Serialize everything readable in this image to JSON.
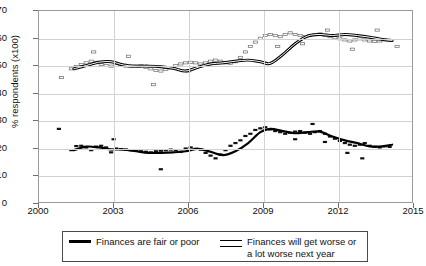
{
  "chart_data": {
    "type": "line",
    "title": "",
    "xlabel": "",
    "ylabel": "% respondents (x100)",
    "xlim": [
      2000,
      2015
    ],
    "ylim": [
      0,
      70
    ],
    "yticks": [
      0,
      10,
      20,
      30,
      40,
      50,
      60,
      70
    ],
    "xticks": [
      2000,
      2003,
      2006,
      2009,
      2012,
      2015
    ],
    "grid": true,
    "legend_position": "bottom",
    "series": [
      {
        "name": "Finances are fair or poor",
        "marker": "filled-dash",
        "line_style": "solid-thick-black",
        "trend_x": [
          2001.4,
          2001.9,
          2002.4,
          2002.9,
          2003.4,
          2003.9,
          2004.4,
          2004.9,
          2005.4,
          2005.9,
          2006.4,
          2006.9,
          2007.4,
          2007.9,
          2008.4,
          2008.9,
          2009.3,
          2009.8,
          2010.3,
          2010.8,
          2011.3,
          2011.8,
          2012.3,
          2012.8,
          2013.3,
          2013.8,
          2014.2
        ],
        "trend_y": [
          19.0,
          20.3,
          20.0,
          19.3,
          19.2,
          18.6,
          18.0,
          18.0,
          18.2,
          18.6,
          19.5,
          18.4,
          17.2,
          18.6,
          21.5,
          25.6,
          26.8,
          26.0,
          25.2,
          25.6,
          25.8,
          24.0,
          22.6,
          21.6,
          20.4,
          20.4,
          21.0
        ],
        "points_x": [
          2001.3,
          2001.5,
          2001.7,
          2001.9,
          2002.1,
          2002.3,
          2002.5,
          2002.7,
          2002.9,
          2003.1,
          2003.3,
          2003.5,
          2003.7,
          2003.9,
          2004.1,
          2004.3,
          2004.5,
          2004.7,
          2004.9,
          2005.1,
          2005.3,
          2005.5,
          2005.7,
          2005.9,
          2006.1,
          2006.3,
          2006.5,
          2006.7,
          2006.9,
          2007.1,
          2007.3,
          2007.5,
          2007.7,
          2007.9,
          2008.1,
          2008.3,
          2008.5,
          2008.7,
          2008.9,
          2009.1,
          2009.3,
          2009.5,
          2009.7,
          2009.9,
          2010.1,
          2010.3,
          2010.5,
          2010.7,
          2010.9,
          2011.1,
          2011.3,
          2011.5,
          2011.7,
          2011.9,
          2012.1,
          2012.3,
          2012.5,
          2012.7,
          2012.9,
          2013.1,
          2013.3,
          2013.5,
          2013.7,
          2013.9,
          2014.1,
          2000.8,
          2003.0,
          2004.9,
          2011.0,
          2012.4,
          2013.0,
          2011.5,
          2010.3
        ],
        "points_y": [
          19.0,
          20.5,
          20.6,
          20.0,
          19.0,
          20.3,
          20.6,
          20.0,
          18.2,
          19.6,
          19.4,
          19.2,
          19.0,
          18.8,
          18.6,
          18.4,
          18.2,
          18.6,
          18.8,
          19.0,
          19.2,
          19.0,
          18.4,
          19.6,
          20.0,
          19.5,
          19.2,
          18.0,
          17.0,
          16.0,
          17.4,
          19.0,
          20.6,
          21.6,
          22.6,
          24.2,
          25.0,
          26.4,
          27.0,
          27.4,
          26.6,
          26.0,
          25.6,
          25.0,
          25.4,
          25.8,
          26.0,
          25.4,
          25.0,
          25.6,
          26.0,
          25.0,
          24.0,
          23.2,
          22.4,
          21.6,
          21.0,
          20.6,
          21.0,
          21.6,
          20.6,
          20.2,
          20.0,
          20.4,
          20.2,
          26.8,
          23.0,
          12.0,
          28.6,
          18.0,
          16.0,
          22.0,
          23.0
        ]
      },
      {
        "name": "Finances will get worse or a lot worse next year",
        "marker": "open-square",
        "line_style": "hollow-double",
        "trend_x": [
          2001.4,
          2001.9,
          2002.4,
          2002.9,
          2003.4,
          2003.9,
          2004.4,
          2004.9,
          2005.4,
          2005.9,
          2006.4,
          2006.9,
          2007.4,
          2007.9,
          2008.4,
          2008.9,
          2009.3,
          2009.8,
          2010.3,
          2010.8,
          2011.3,
          2011.8,
          2012.3,
          2012.8,
          2013.3,
          2013.8,
          2014.2
        ],
        "trend_y": [
          48.8,
          50.0,
          51.2,
          51.4,
          50.2,
          49.8,
          49.8,
          49.6,
          49.0,
          48.0,
          49.4,
          50.6,
          51.0,
          51.6,
          52.0,
          51.4,
          50.8,
          54.0,
          58.0,
          60.8,
          61.4,
          61.0,
          61.4,
          61.0,
          60.4,
          59.6,
          59.2
        ],
        "points_x": [
          2001.3,
          2001.5,
          2001.7,
          2001.9,
          2002.1,
          2002.3,
          2002.5,
          2002.7,
          2002.9,
          2003.1,
          2003.3,
          2003.5,
          2003.7,
          2003.9,
          2004.1,
          2004.3,
          2004.5,
          2004.7,
          2004.9,
          2005.1,
          2005.3,
          2005.5,
          2005.7,
          2005.9,
          2006.1,
          2006.3,
          2006.5,
          2006.7,
          2006.9,
          2007.1,
          2007.3,
          2007.5,
          2007.7,
          2007.9,
          2008.1,
          2008.3,
          2008.5,
          2008.7,
          2008.9,
          2009.1,
          2009.3,
          2009.5,
          2009.7,
          2009.9,
          2010.1,
          2010.3,
          2010.5,
          2010.7,
          2010.9,
          2011.1,
          2011.3,
          2011.5,
          2011.7,
          2011.9,
          2012.1,
          2012.3,
          2012.5,
          2012.7,
          2012.9,
          2013.1,
          2013.3,
          2013.5,
          2013.7,
          2013.9,
          2014.1,
          2000.9,
          2002.2,
          2003.6,
          2004.6,
          2006.0,
          2009.6,
          2010.6,
          2011.6,
          2012.6,
          2013.6,
          2014.4
        ],
        "points_y": [
          48.8,
          49.6,
          50.4,
          51.0,
          51.6,
          51.2,
          50.4,
          50.0,
          49.8,
          50.0,
          50.2,
          49.8,
          49.6,
          49.8,
          50.0,
          49.4,
          48.8,
          48.2,
          48.0,
          48.6,
          49.2,
          50.0,
          50.6,
          51.0,
          51.2,
          51.0,
          50.6,
          51.0,
          51.6,
          52.0,
          51.6,
          51.0,
          50.8,
          51.4,
          53.0,
          55.0,
          57.0,
          58.6,
          60.0,
          61.0,
          61.4,
          61.0,
          60.6,
          61.4,
          62.0,
          61.4,
          61.0,
          60.6,
          61.0,
          61.4,
          61.6,
          61.0,
          60.6,
          60.2,
          59.8,
          59.4,
          59.0,
          59.4,
          59.8,
          59.4,
          59.0,
          58.8,
          59.0,
          59.4,
          59.2,
          45.6,
          55.0,
          53.4,
          43.0,
          48.0,
          57.0,
          58.0,
          63.0,
          56.0,
          63.0,
          57.0
        ]
      }
    ]
  },
  "legend": {
    "entries": [
      {
        "label": "Finances are fair or poor",
        "swatch": "solid-line-swatch"
      },
      {
        "label": "Finances will get worse or a lot worse next year",
        "swatch": "hollow-line-swatch"
      }
    ]
  }
}
